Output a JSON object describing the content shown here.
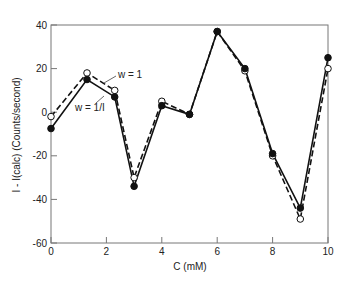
{
  "chart_data": {
    "type": "line",
    "title": "",
    "xlabel": "C (mM)",
    "ylabel": "I - I(calc) (Counts/second)",
    "xlim": [
      0,
      10
    ],
    "ylim": [
      -60,
      40
    ],
    "xticks": [
      0,
      2,
      4,
      6,
      8,
      10
    ],
    "yticks": [
      -60,
      -40,
      -20,
      0,
      20,
      40
    ],
    "grid": false,
    "x": [
      0,
      1.3,
      2.3,
      3,
      4,
      5,
      6,
      7,
      8,
      9,
      10
    ],
    "series": [
      {
        "name": "w = 1",
        "style": "dashed",
        "marker": "open-circle",
        "values": [
          -2,
          18,
          10,
          -30,
          5,
          -1,
          37,
          19,
          -20,
          -49,
          20
        ]
      },
      {
        "name": "w = 1/I",
        "style": "solid",
        "marker": "filled-circle",
        "values": [
          -7.5,
          15,
          7,
          -34,
          3,
          -1,
          37,
          20,
          -19,
          -44,
          25
        ]
      }
    ],
    "annotations": [
      {
        "text": "w = 1",
        "near_series": "dashed"
      },
      {
        "text": "w = 1/I",
        "near_series": "solid"
      }
    ]
  },
  "labels": {
    "xlabel": "C (mM)",
    "ylabel": "I - I(calc) (Counts/second)",
    "legend_dashed": "w = 1",
    "legend_solid": "w = 1/I"
  }
}
